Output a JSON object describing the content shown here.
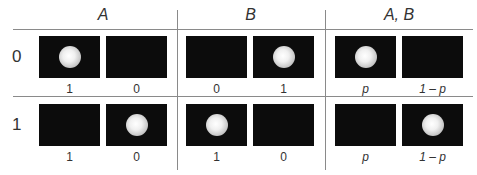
{
  "columns": [
    {
      "label": "A",
      "x": 39
    },
    {
      "label": "B",
      "x": 186
    },
    {
      "label": "A, B",
      "x": 335
    }
  ],
  "rows": [
    {
      "label": "0",
      "cells": [
        {
          "boxes": [
            {
              "ball": true,
              "value": "1"
            },
            {
              "ball": false,
              "value": "0"
            }
          ]
        },
        {
          "boxes": [
            {
              "ball": false,
              "value": "0"
            },
            {
              "ball": true,
              "value": "1"
            }
          ]
        },
        {
          "boxes": [
            {
              "ball": true,
              "value": "p"
            },
            {
              "ball": false,
              "value": "1 – p"
            }
          ]
        }
      ]
    },
    {
      "label": "1",
      "cells": [
        {
          "boxes": [
            {
              "ball": false,
              "value": "1"
            },
            {
              "ball": true,
              "value": "0"
            }
          ]
        },
        {
          "boxes": [
            {
              "ball": true,
              "value": "1"
            },
            {
              "ball": false,
              "value": "0"
            }
          ]
        },
        {
          "boxes": [
            {
              "ball": false,
              "value": "p"
            },
            {
              "ball": true,
              "value": "1 – p"
            }
          ]
        }
      ]
    }
  ],
  "colors": {
    "box": "#0c0c0c",
    "line": "#8a8a8a",
    "text": "#333333"
  }
}
